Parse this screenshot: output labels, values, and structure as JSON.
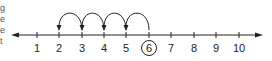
{
  "edge_text": [
    "g",
    "e",
    "e",
    "t"
  ],
  "number_line": {
    "labels": [
      "1",
      "2",
      "3",
      "4",
      "5",
      "6",
      "7",
      "8",
      "9",
      "10"
    ],
    "circled": "6",
    "hops": [
      {
        "from": "6",
        "to": "5"
      },
      {
        "from": "5",
        "to": "4"
      },
      {
        "from": "4",
        "to": "3"
      },
      {
        "from": "3",
        "to": "2"
      }
    ],
    "color": "#222222"
  }
}
